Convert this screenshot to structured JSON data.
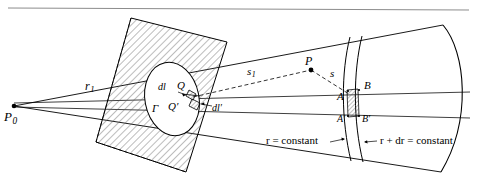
{
  "figure": {
    "kind": "geometric-optics-diagram",
    "background_color": "#ffffff",
    "ink_color": "#000000",
    "hatch_color": "#555555"
  },
  "top_rule": {
    "present": true,
    "color": "#888888"
  },
  "labels": {
    "source_point": "P",
    "source_point_sub": "0",
    "radius_first": "r",
    "radius_first_sub": "1",
    "element_dl": "dl",
    "element_dl_prime": "dl′",
    "point_Q": "Q",
    "point_Q_prime": "Q′",
    "contour_gamma": "Γ",
    "distance_s1": "s",
    "distance_s1_sub": "1",
    "distance_s": "s",
    "field_point": "P",
    "corner_A": "A",
    "corner_B": "B",
    "corner_A_prime": "A′",
    "corner_B_prime": "B′",
    "shell_inner": "r = constant",
    "shell_outer": "r + dr = constant"
  },
  "geometry": {
    "apex": {
      "x": 14,
      "y": 106
    },
    "cone_rays": [
      {
        "name": "upper-edge",
        "from": [
          14,
          106
        ],
        "to": [
          462,
          22
        ]
      },
      {
        "name": "upper-mid",
        "from": [
          14,
          106
        ],
        "to": [
          470,
          94
        ]
      },
      {
        "name": "axis",
        "from": [
          14,
          106
        ],
        "to": [
          470,
          110
        ]
      },
      {
        "name": "lower-edge",
        "from": [
          14,
          106
        ],
        "to": [
          462,
          176
        ]
      }
    ],
    "aperture_plane": {
      "points": [
        [
          131,
          18
        ],
        [
          227,
          42
        ],
        [
          186,
          172
        ],
        [
          96,
          142
        ]
      ],
      "hatched": true
    },
    "aperture_contour": {
      "center": [
        173,
        98
      ],
      "rx": 26,
      "ry": 36,
      "rotation": -12
    },
    "wavefront_inner": {
      "label_key": "shell_inner"
    },
    "wavefront_outer": {
      "label_key": "shell_outer"
    },
    "patch": {
      "corners": [
        "A",
        "B",
        "A′",
        "B′"
      ],
      "hatched": true
    },
    "point_P": {
      "x": 311,
      "y": 70
    }
  }
}
